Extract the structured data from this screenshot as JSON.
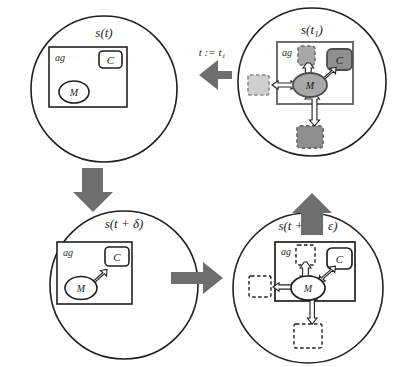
{
  "figure": {
    "type": "state-transition-cycle-diagram",
    "background": "#ffffff",
    "stroke_color": "#231f20",
    "block_arrow_color": "#6e6e6e",
    "fill_dark_gray": "#8a8a8a",
    "fill_light_gray": "#c9c9c9",
    "fill_white": "#ffffff"
  },
  "panels": {
    "top_left": {
      "title": "s(t)",
      "agent_label": "ag",
      "memory_label": "M",
      "controller_label": "C",
      "style": "plain",
      "has_internal_arrows": false,
      "has_external_boxes": false
    },
    "top_right": {
      "title": "s(t₁)",
      "agent_label": "ag",
      "memory_label": "M",
      "controller_label": "C",
      "style": "filled-gray",
      "has_internal_arrows": true,
      "has_external_boxes": true,
      "external_boxes": [
        "left",
        "top-inner",
        "bottom"
      ]
    },
    "bottom_left": {
      "title": "s(t + δ)",
      "agent_label": "ag",
      "memory_label": "M",
      "controller_label": "C",
      "style": "plain-with-mc-arrow",
      "has_internal_arrows": true,
      "has_external_boxes": false
    },
    "bottom_right": {
      "title": "s(t + δ + ε)",
      "agent_label": "ag",
      "memory_label": "M",
      "controller_label": "C",
      "style": "dashed-white",
      "has_internal_arrows": true,
      "has_external_boxes": true,
      "external_boxes": [
        "left",
        "top-inner",
        "bottom"
      ]
    }
  },
  "transitions": {
    "top": {
      "label": "t := t₁",
      "direction": "left",
      "from": "top_right",
      "to": "top_left"
    },
    "left": {
      "label": "",
      "direction": "down",
      "from": "top_left",
      "to": "bottom_left"
    },
    "bottom": {
      "label": "",
      "direction": "right",
      "from": "bottom_left",
      "to": "bottom_right"
    },
    "right": {
      "label": "",
      "direction": "up",
      "from": "bottom_right",
      "to": "top_right"
    }
  }
}
